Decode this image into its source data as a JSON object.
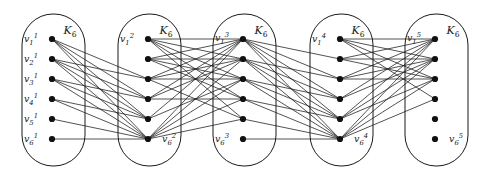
{
  "figure": {
    "type": "graph-diagram",
    "width": 478,
    "height": 178,
    "background_color": "#ffffff",
    "stroke_color": "#1a1a1a",
    "vertex_color": "#111111",
    "vertex_radius": 3.1,
    "capsule_stroke_width": 1.0,
    "edge_stroke_width": 0.75,
    "blocks": [
      {
        "id": 1,
        "title": "K_6",
        "title_html": "K<sub>6</sub>",
        "title_x": 70,
        "title_y": 34,
        "capsule": {
          "x": 22,
          "y": 14,
          "width": 63,
          "height": 152,
          "rx": 31
        },
        "vertex_x": 52,
        "vertex_ys": [
          39,
          59,
          79,
          99,
          119,
          139
        ],
        "labels": [
          {
            "text": "v_1^1",
            "base": "v",
            "sub": "1",
            "sup": "1",
            "x": 38,
            "y": 39,
            "side": "left"
          },
          {
            "text": "v_2^1",
            "base": "v",
            "sub": "2",
            "sup": "1",
            "x": 38,
            "y": 59,
            "side": "left"
          },
          {
            "text": "v_3^1",
            "base": "v",
            "sub": "3",
            "sup": "1",
            "x": 38,
            "y": 79,
            "side": "left"
          },
          {
            "text": "v_4^1",
            "base": "v",
            "sub": "4",
            "sup": "1",
            "x": 38,
            "y": 99,
            "side": "left"
          },
          {
            "text": "v_5^1",
            "base": "v",
            "sub": "5",
            "sup": "1",
            "x": 38,
            "y": 119,
            "side": "left"
          },
          {
            "text": "v_6^1",
            "base": "v",
            "sub": "6",
            "sup": "1",
            "x": 38,
            "y": 139,
            "side": "left"
          }
        ]
      },
      {
        "id": 2,
        "title": "K_6",
        "title_html": "K<sub>6</sub>",
        "title_x": 166,
        "title_y": 34,
        "capsule": {
          "x": 118,
          "y": 14,
          "width": 63,
          "height": 152,
          "rx": 31
        },
        "vertex_x": 148,
        "vertex_ys": [
          39,
          59,
          79,
          99,
          119,
          139
        ],
        "labels": [
          {
            "text": "v_1^2",
            "base": "v",
            "sub": "1",
            "sup": "2",
            "x": 134,
            "y": 39,
            "side": "left"
          },
          {
            "text": "v_6^2",
            "base": "v",
            "sub": "6",
            "sup": "2",
            "x": 162,
            "y": 139,
            "side": "right"
          }
        ]
      },
      {
        "id": 3,
        "title": "K_6",
        "title_html": "K<sub>6</sub>",
        "title_x": 261,
        "title_y": 34,
        "capsule": {
          "x": 213,
          "y": 14,
          "width": 63,
          "height": 152,
          "rx": 31
        },
        "vertex_x": 243,
        "vertex_ys": [
          39,
          59,
          79,
          99,
          119,
          139
        ],
        "labels": [
          {
            "text": "v_1^3",
            "base": "v",
            "sub": "1",
            "sup": "3",
            "x": 229,
            "y": 38,
            "side": "left"
          },
          {
            "text": "v_6^3",
            "base": "v",
            "sub": "6",
            "sup": "3",
            "x": 229,
            "y": 139,
            "side": "left"
          }
        ]
      },
      {
        "id": 4,
        "title": "K_6",
        "title_html": "K<sub>6</sub>",
        "title_x": 358,
        "title_y": 34,
        "capsule": {
          "x": 310,
          "y": 14,
          "width": 63,
          "height": 152,
          "rx": 31
        },
        "vertex_x": 340,
        "vertex_ys": [
          39,
          59,
          79,
          99,
          119,
          139
        ],
        "labels": [
          {
            "text": "v_1^4",
            "base": "v",
            "sub": "1",
            "sup": "4",
            "x": 326,
            "y": 39,
            "side": "left"
          },
          {
            "text": "v_6^4",
            "base": "v",
            "sub": "6",
            "sup": "4",
            "x": 354,
            "y": 139,
            "side": "right"
          }
        ]
      },
      {
        "id": 5,
        "title": "K_6",
        "title_html": "K<sub>6</sub>",
        "title_x": 453,
        "title_y": 34,
        "capsule": {
          "x": 405,
          "y": 14,
          "width": 63,
          "height": 152,
          "rx": 31
        },
        "vertex_x": 435,
        "vertex_ys": [
          39,
          59,
          79,
          99,
          119,
          139
        ],
        "labels": [
          {
            "text": "v_1^5",
            "base": "v",
            "sub": "1",
            "sup": "5",
            "x": 421,
            "y": 38,
            "side": "left"
          },
          {
            "text": "v_6^5",
            "base": "v",
            "sub": "6",
            "sup": "5",
            "x": 449,
            "y": 139,
            "side": "right"
          }
        ]
      }
    ],
    "bridges": [
      {
        "from_block": 1,
        "to_block": 2,
        "pairs": [
          [
            1,
            3
          ],
          [
            1,
            4
          ],
          [
            1,
            5
          ],
          [
            1,
            6
          ],
          [
            2,
            3
          ],
          [
            2,
            4
          ],
          [
            2,
            5
          ],
          [
            2,
            6
          ],
          [
            3,
            4
          ],
          [
            3,
            5
          ],
          [
            3,
            6
          ],
          [
            4,
            5
          ],
          [
            4,
            6
          ],
          [
            5,
            6
          ],
          [
            6,
            6
          ]
        ]
      },
      {
        "from_block": 2,
        "to_block": 3,
        "pairs": [
          [
            1,
            1
          ],
          [
            1,
            2
          ],
          [
            1,
            3
          ],
          [
            1,
            4
          ],
          [
            1,
            5
          ],
          [
            2,
            1
          ],
          [
            2,
            2
          ],
          [
            2,
            3
          ],
          [
            2,
            4
          ],
          [
            3,
            1
          ],
          [
            3,
            2
          ],
          [
            3,
            3
          ],
          [
            3,
            5
          ],
          [
            4,
            1
          ],
          [
            4,
            2
          ],
          [
            4,
            4
          ],
          [
            5,
            1
          ],
          [
            5,
            3
          ],
          [
            6,
            1
          ],
          [
            6,
            2
          ],
          [
            6,
            3
          ],
          [
            6,
            4
          ],
          [
            6,
            5
          ]
        ]
      },
      {
        "from_block": 3,
        "to_block": 4,
        "pairs": [
          [
            1,
            2
          ],
          [
            1,
            3
          ],
          [
            1,
            4
          ],
          [
            1,
            5
          ],
          [
            1,
            6
          ],
          [
            2,
            3
          ],
          [
            2,
            4
          ],
          [
            2,
            5
          ],
          [
            2,
            6
          ],
          [
            3,
            4
          ],
          [
            3,
            5
          ],
          [
            3,
            6
          ],
          [
            4,
            5
          ],
          [
            4,
            6
          ],
          [
            5,
            6
          ],
          [
            6,
            6
          ]
        ]
      },
      {
        "from_block": 4,
        "to_block": 5,
        "pairs": [
          [
            1,
            1
          ],
          [
            1,
            2
          ],
          [
            1,
            3
          ],
          [
            1,
            4
          ],
          [
            2,
            1
          ],
          [
            2,
            2
          ],
          [
            2,
            3
          ],
          [
            3,
            1
          ],
          [
            3,
            2
          ],
          [
            3,
            3
          ],
          [
            4,
            1
          ],
          [
            4,
            2
          ],
          [
            5,
            1
          ],
          [
            5,
            2
          ],
          [
            5,
            3
          ],
          [
            6,
            1
          ],
          [
            6,
            2
          ],
          [
            6,
            3
          ],
          [
            6,
            4
          ]
        ]
      }
    ]
  }
}
